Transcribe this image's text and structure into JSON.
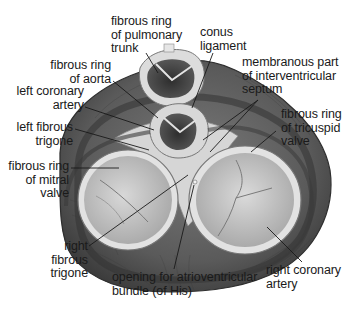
{
  "figure": {
    "style": "grayscale anatomical illustration",
    "colors": {
      "background": "#ffffff",
      "myocardium_dark": "#4a4a4a",
      "myocardium_mid": "#6e6e6e",
      "fibrous_tissue": "#d9d9d9",
      "valve_leaflets": "#c4c4c4",
      "text": "#1a1a1a",
      "leader_line": "#1a1a1a"
    }
  },
  "labels": {
    "pulmonary_ring": "fibrous ring\nof pulmonary\ntrunk",
    "conus_ligament": "conus\nligament",
    "aortic_ring": "fibrous ring\nof aorta",
    "membranous_septum": "membranous part\nof interventricular\nseptum",
    "left_coronary": "left coronary\nartery",
    "left_trigone": "left fibrous\ntrigone",
    "tricuspid_ring": "fibrous ring\nof tricuspid\nvalve",
    "mitral_ring": "fibrous ring\nof mitral\nvalve",
    "right_trigone": "right\nfibrous\ntrigone",
    "av_bundle_opening": "opening for atrioventricular\nbundle (of His)",
    "right_coronary": "right coronary\nartery"
  }
}
